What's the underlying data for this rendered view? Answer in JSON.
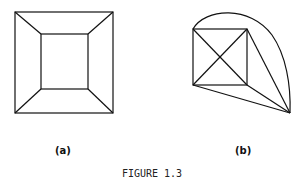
{
  "figure": {
    "caption": "FIGURE 1.3",
    "panels": [
      {
        "label": "(a)",
        "description": "square within square with corners connected"
      },
      {
        "label": "(b)",
        "description": "square with diagonals, external vertex connected, arc edge"
      }
    ],
    "stroke_color": "#111111"
  }
}
